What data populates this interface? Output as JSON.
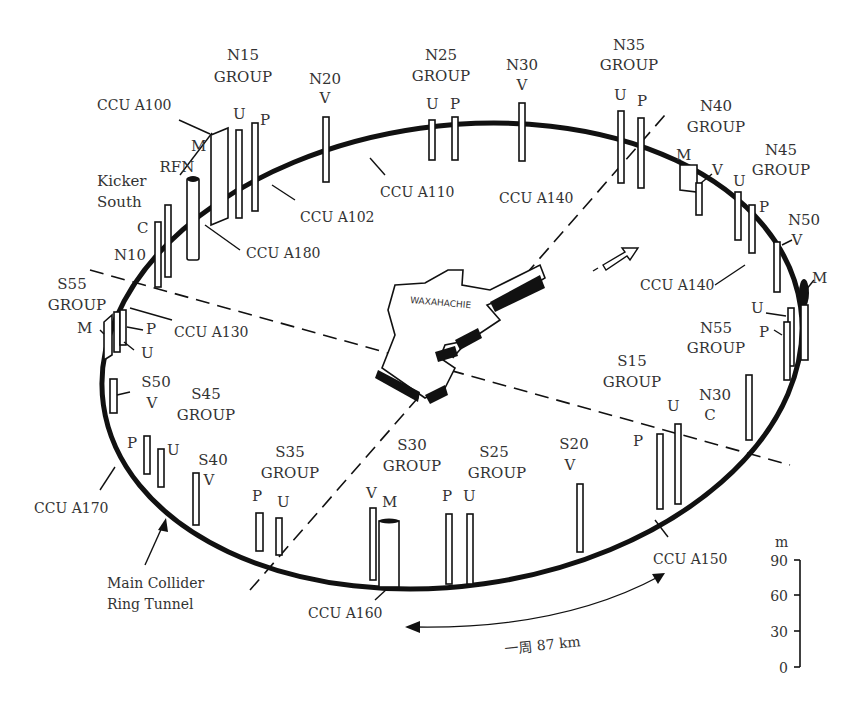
{
  "ring": {
    "label_line1": "Main Collider",
    "label_line2": "Ring Tunnel",
    "circumference_label": "一周 87 km"
  },
  "city": {
    "name": "WAXAHACHIE"
  },
  "site_groups": [
    {
      "id": "N15",
      "line1": "N15",
      "line2": "GROUP",
      "shafts": [
        "M",
        "U",
        "P"
      ]
    },
    {
      "id": "N20",
      "line1": "N20",
      "line2": "V",
      "shafts": [
        "V"
      ]
    },
    {
      "id": "N25",
      "line1": "N25",
      "line2": "GROUP",
      "shafts": [
        "U",
        "P"
      ]
    },
    {
      "id": "N30a",
      "line1": "N30",
      "line2": "V",
      "shafts": [
        "V"
      ]
    },
    {
      "id": "N35",
      "line1": "N35",
      "line2": "GROUP",
      "shafts": [
        "U",
        "P"
      ]
    },
    {
      "id": "N40",
      "line1": "N40",
      "line2": "GROUP",
      "shafts": [
        "M",
        "V"
      ]
    },
    {
      "id": "N45",
      "line1": "N45",
      "line2": "GROUP",
      "shafts": [
        "U",
        "P"
      ]
    },
    {
      "id": "N50",
      "line1": "N50",
      "line2": "V",
      "shafts": [
        "V",
        "M"
      ]
    },
    {
      "id": "N55",
      "line1": "N55",
      "line2": "GROUP",
      "shafts": [
        "U",
        "P"
      ]
    },
    {
      "id": "N30b",
      "line1": "N30",
      "line2": "C",
      "shafts": [
        "C"
      ]
    },
    {
      "id": "S15",
      "line1": "S15",
      "line2": "GROUP",
      "shafts": [
        "P",
        "U"
      ]
    },
    {
      "id": "S20",
      "line1": "S20",
      "line2": "V",
      "shafts": [
        "V"
      ]
    },
    {
      "id": "S25",
      "line1": "S25",
      "line2": "GROUP",
      "shafts": [
        "P",
        "U"
      ]
    },
    {
      "id": "S30",
      "line1": "S30",
      "line2": "GROUP",
      "shafts": [
        "V",
        "M"
      ]
    },
    {
      "id": "S35",
      "line1": "S35",
      "line2": "GROUP",
      "shafts": [
        "P",
        "U"
      ]
    },
    {
      "id": "S40",
      "line1": "S40",
      "line2": "V",
      "shafts": [
        "V"
      ]
    },
    {
      "id": "S45",
      "line1": "S45",
      "line2": "GROUP",
      "shafts": [
        "P",
        "U"
      ]
    },
    {
      "id": "S50",
      "line1": "S50",
      "line2": "V",
      "shafts": [
        "V"
      ]
    },
    {
      "id": "S55",
      "line1": "S55",
      "line2": "GROUP",
      "shafts": [
        "M",
        "P",
        "U"
      ]
    },
    {
      "id": "N10",
      "line1": "N10",
      "line2": "",
      "shafts": [
        "C"
      ]
    },
    {
      "id": "KickerSouth",
      "line1": "Kicker",
      "line2": "South",
      "shafts": [
        "C"
      ]
    },
    {
      "id": "RFN",
      "line1": "RFN",
      "line2": "",
      "shafts": [
        "RFN"
      ]
    }
  ],
  "ccu_labels": [
    "CCU A100",
    "CCU A102",
    "CCU A110",
    "CCU A140",
    "CCU A140",
    "CCU A180",
    "CCU A130",
    "CCU A170",
    "CCU A160",
    "CCU A150"
  ],
  "shaft_letters": {
    "M": "M",
    "U": "U",
    "P": "P",
    "V": "V",
    "C": "C"
  },
  "scale": {
    "unit": "m",
    "ticks": [
      "90",
      "60",
      "30",
      "0"
    ]
  }
}
